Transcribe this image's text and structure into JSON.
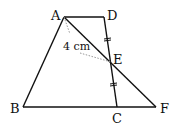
{
  "diagram": {
    "points": {
      "A": {
        "label": "A",
        "x": 64,
        "y": 17
      },
      "D": {
        "label": "D",
        "x": 104,
        "y": 17
      },
      "E": {
        "label": "E",
        "x": 111,
        "y": 62
      },
      "B": {
        "label": "B",
        "x": 23,
        "y": 107
      },
      "C": {
        "label": "C",
        "x": 117,
        "y": 107
      },
      "F": {
        "label": "F",
        "x": 156,
        "y": 107
      }
    },
    "segments": [
      "AD",
      "AB",
      "BF",
      "DC",
      "AF"
    ],
    "dotted_segments": [
      "A-E (distance)"
    ],
    "tick_marks": [
      "DE",
      "EC"
    ],
    "measurement_label": "4 cm",
    "colors": {
      "line": "#111111",
      "dotted": "#999999"
    }
  }
}
